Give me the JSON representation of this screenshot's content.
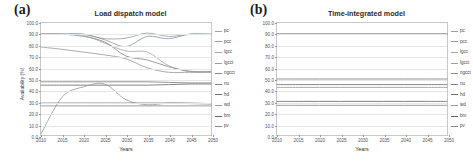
{
  "figure": {
    "panels": [
      {
        "id": "a",
        "label": "(a)",
        "title": "Load dispatch model"
      },
      {
        "id": "b",
        "label": "(b)",
        "title": "Time-integrated model"
      }
    ]
  },
  "axes": {
    "ylabel": "Availability (%)",
    "xlabel": "Years",
    "yticks": [
      "100.0",
      "90.0",
      "80.0",
      "70.0",
      "60.0",
      "50.0",
      "40.0",
      "30.0",
      "20.0",
      "10.0",
      "0.0"
    ],
    "xticks": [
      "2010",
      "2015",
      "2020",
      "2025",
      "2030",
      "2035",
      "2040",
      "2045",
      "2050"
    ]
  },
  "legend": {
    "entries": [
      {
        "label": "pc",
        "color": "#9aa3ab"
      },
      {
        "label": "pcc",
        "color": "#8f9aa3"
      },
      {
        "label": "lgcc",
        "color": "#a8a8a8"
      },
      {
        "label": "lgcct",
        "color": "#9c9c9c"
      },
      {
        "label": "ngcct",
        "color": "#8d8d8d"
      },
      {
        "label": "nu",
        "color": "#7e7e7e"
      },
      {
        "label": "hd",
        "color": "#6f6f6f"
      },
      {
        "label": "wd",
        "color": "#9b9b9b"
      },
      {
        "label": "bm",
        "color": "#6a6a6a"
      },
      {
        "label": "pv",
        "color": "#8a8a8a"
      }
    ]
  },
  "chart_data": [
    {
      "type": "line",
      "title": "Load dispatch model",
      "xlabel": "Years",
      "ylabel": "Availability (%)",
      "xlim": [
        2010,
        2050
      ],
      "ylim": [
        0,
        100
      ],
      "grid": true,
      "legend_position": "right",
      "x": [
        2010,
        2015,
        2020,
        2025,
        2030,
        2035,
        2040,
        2045,
        2050
      ],
      "series": [
        {
          "name": "pc",
          "values": [
            90.0,
            90.0,
            90.0,
            86.0,
            86.5,
            91.0,
            88.0,
            90.0,
            90.0
          ]
        },
        {
          "name": "pcc",
          "values": [
            90.0,
            90.0,
            90.0,
            85.0,
            79.0,
            88.0,
            86.0,
            90.0,
            90.0
          ]
        },
        {
          "name": "lgcc",
          "values": [
            90.0,
            90.0,
            89.0,
            82.0,
            75.0,
            74.0,
            62.0,
            56.5,
            56.5
          ]
        },
        {
          "name": "lgcct",
          "values": [
            78.5,
            76.5,
            74.0,
            71.5,
            68.0,
            60.0,
            56.0,
            56.0,
            56.0
          ]
        },
        {
          "name": "ngcct",
          "values": [
            90.0,
            90.0,
            88.0,
            83.0,
            70.5,
            67.0,
            61.0,
            57.0,
            56.5
          ]
        },
        {
          "name": "nu",
          "values": [
            47.5,
            47.5,
            47.5,
            47.5,
            47.5,
            47.5,
            47.0,
            46.5,
            46.5
          ]
        },
        {
          "name": "hd",
          "values": [
            44.5,
            44.5,
            44.5,
            44.5,
            44.5,
            44.5,
            45.0,
            45.5,
            45.5
          ]
        },
        {
          "name": "wd",
          "values": [
            1.0,
            34.0,
            43.0,
            45.5,
            31.5,
            27.0,
            28.5,
            28.0,
            27.5
          ]
        },
        {
          "name": "bm",
          "values": [
            28.5,
            28.5,
            28.5,
            28.5,
            28.5,
            28.5,
            28.5,
            28.5,
            28.0
          ]
        },
        {
          "name": "pv",
          "values": [
            26.0,
            26.0,
            26.0,
            26.0,
            26.0,
            26.0,
            26.0,
            26.0,
            26.0
          ]
        }
      ]
    },
    {
      "type": "line",
      "title": "Time-integrated model",
      "xlabel": "Years",
      "ylabel": "Availability (%)",
      "xlim": [
        2010,
        2050
      ],
      "ylim": [
        0,
        100
      ],
      "grid": true,
      "legend_position": "right",
      "x": [
        2010,
        2015,
        2020,
        2025,
        2030,
        2035,
        2040,
        2045,
        2050
      ],
      "series": [
        {
          "name": "pc",
          "values": [
            90.0,
            90.0,
            90.0,
            90.0,
            90.0,
            90.0,
            90.0,
            90.0,
            90.0
          ]
        },
        {
          "name": "pcc",
          "values": [
            90.0,
            90.0,
            90.0,
            90.0,
            90.0,
            90.0,
            90.0,
            90.0,
            90.0
          ]
        },
        {
          "name": "lgcc",
          "values": [
            90.0,
            90.0,
            90.0,
            90.0,
            90.0,
            90.0,
            90.0,
            90.0,
            90.0
          ]
        },
        {
          "name": "lgcct",
          "values": [
            90.0,
            90.0,
            90.0,
            90.0,
            90.0,
            90.0,
            90.0,
            90.0,
            90.0
          ]
        },
        {
          "name": "ngcct",
          "values": [
            90.0,
            90.0,
            90.0,
            90.0,
            90.0,
            90.0,
            90.0,
            90.0,
            90.0
          ]
        },
        {
          "name": "nu",
          "values": [
            50.0,
            50.0,
            50.0,
            50.0,
            50.0,
            50.0,
            50.0,
            50.0,
            50.0
          ]
        },
        {
          "name": "hd",
          "values": [
            45.0,
            45.0,
            45.0,
            45.0,
            45.0,
            45.0,
            45.0,
            45.0,
            45.0
          ]
        },
        {
          "name": "wd",
          "values": [
            42.5,
            42.5,
            42.5,
            42.5,
            42.5,
            42.5,
            42.5,
            42.5,
            42.5
          ]
        },
        {
          "name": "bm",
          "values": [
            30.0,
            30.0,
            30.0,
            30.0,
            30.0,
            30.0,
            30.0,
            30.0,
            30.0
          ]
        },
        {
          "name": "pv",
          "values": [
            26.5,
            26.5,
            26.5,
            26.5,
            26.5,
            26.5,
            26.5,
            26.5,
            26.5
          ]
        }
      ]
    }
  ]
}
